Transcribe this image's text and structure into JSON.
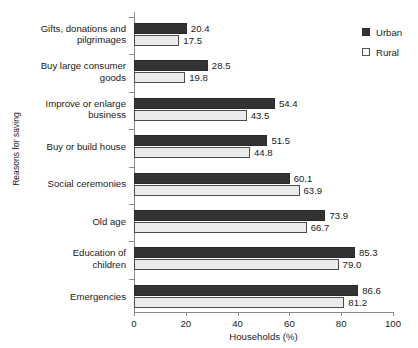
{
  "chart_data": {
    "type": "bar",
    "orientation": "horizontal",
    "title": "",
    "xlabel": "Households (%)",
    "ylabel": "Reasons for saving",
    "xlim": [
      0,
      100
    ],
    "xticks": [
      0,
      20,
      40,
      60,
      80,
      100
    ],
    "grid": false,
    "legend_position": "top-right",
    "categories": [
      "Gifts, donations and pilgrimages",
      "Buy large consumer goods",
      "Improve or enlarge business",
      "Buy or build house",
      "Social ceremonies",
      "Old age",
      "Education of children",
      "Emergencies"
    ],
    "category_lines": [
      [
        "Gifts, donations and",
        "pilgrimages"
      ],
      [
        "Buy large consumer",
        "goods"
      ],
      [
        "Improve or enlarge",
        "business"
      ],
      [
        "Buy or build house"
      ],
      [
        "Social ceremonies"
      ],
      [
        "Old age"
      ],
      [
        "Education of",
        "children"
      ],
      [
        "Emergencies"
      ]
    ],
    "series": [
      {
        "name": "Urban",
        "color": "#333333",
        "values": [
          20.4,
          28.5,
          54.4,
          51.5,
          60.1,
          73.9,
          85.3,
          86.6
        ],
        "labels": [
          "20.4",
          "28.5",
          "54.4",
          "51.5",
          "60.1",
          "73.9",
          "85.3",
          "86.6"
        ]
      },
      {
        "name": "Rural",
        "color": "#ebebeb",
        "values": [
          17.5,
          19.8,
          43.5,
          44.8,
          63.9,
          66.7,
          79.0,
          81.2
        ],
        "labels": [
          "17.5",
          "19.8",
          "43.5",
          "44.8",
          "63.9",
          "66.7",
          "79.0",
          "81.2"
        ]
      }
    ]
  },
  "legend": {
    "items": [
      {
        "label": "Urban",
        "style": "filled"
      },
      {
        "label": "Rural",
        "style": "outlined"
      }
    ]
  },
  "axis": {
    "x_title": "Households (%)",
    "y_title": "Reasons for saving",
    "x_tick_labels": [
      "0",
      "20",
      "40",
      "60",
      "80",
      "100"
    ]
  }
}
